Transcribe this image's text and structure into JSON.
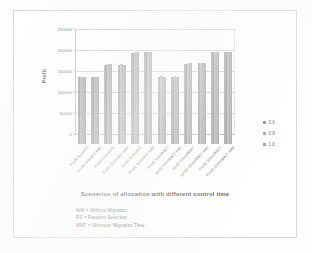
{
  "chart_data": {
    "type": "bar",
    "title": "",
    "xlabel": "Scenarios of allocation with different control time",
    "ylabel": "Profit",
    "ylim": [
      0,
      250000
    ],
    "ytick_labels": [
      "0",
      "50000",
      "100000",
      "150000",
      "200000",
      "250000"
    ],
    "ytick_values": [
      0,
      50000,
      100000,
      150000,
      200000,
      250000
    ],
    "grid": true,
    "legend_position": "right",
    "categories": [
      "Profit 5mmRS",
      "Profit 5mmRS-WM",
      "Profit 15mmRS",
      "Profit 15mmRS-WM",
      "Profit 30mmRS",
      "Profit 30mmRS-WM",
      "Profit 5mmMMT",
      "profit 5mmMMT-WM",
      "profit 15mmMMT",
      "profit 15mmMMT-WM",
      "Profit 30mmMMT",
      "Profit 30mmMMT-WM"
    ],
    "series": [
      {
        "name": "0.6",
        "color": "#8f8f8f",
        "values": [
          159000,
          159000,
          189000,
          189000,
          217000,
          218000,
          160000,
          160000,
          191000,
          192000,
          219000,
          218000
        ]
      },
      {
        "name": "0.8",
        "color": "#a4a4a4",
        "values": [
          160000,
          160000,
          190000,
          190000,
          218000,
          219000,
          161000,
          161000,
          192000,
          193000,
          220000,
          219000
        ]
      },
      {
        "name": "1.0",
        "color": "#9a9a9a",
        "values": [
          160000,
          159000,
          190000,
          189000,
          218000,
          218000,
          160000,
          160000,
          192000,
          192000,
          220000,
          219000
        ]
      }
    ]
  },
  "legend": {
    "items": [
      {
        "label": "0.6"
      },
      {
        "label": "0.8"
      },
      {
        "label": "1.0"
      }
    ]
  },
  "notes": {
    "line1": "WM = Without Migration",
    "line2": "RS = Random Selection",
    "line3": "MMT = Minimum Migration Time"
  }
}
